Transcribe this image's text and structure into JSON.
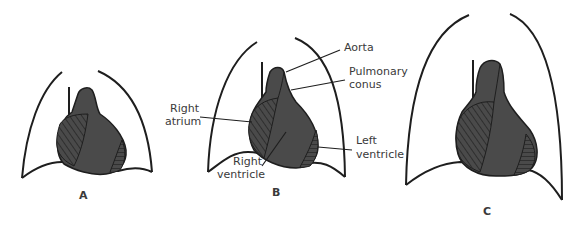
{
  "figure": {
    "panels": [
      {
        "id": "A",
        "letter": "A",
        "description": "Small heart silhouette within chest outline"
      },
      {
        "id": "B",
        "letter": "B",
        "description": "Labeled heart silhouette within chest outline"
      },
      {
        "id": "C",
        "letter": "C",
        "description": "Large chest outline with elongated heart silhouette"
      }
    ],
    "labels": {
      "aorta": "Aorta",
      "pulmonary_conus_line1": "Pulmonary",
      "pulmonary_conus_line2": "conus",
      "right_atrium_line1": "Right",
      "right_atrium_line2": "atrium",
      "left_ventricle_line1": "Left",
      "left_ventricle_line2": "ventricle",
      "right_ventricle_line1": "Right",
      "right_ventricle_line2": "ventricle"
    },
    "colors": {
      "heart_fill": "#4a4a4a",
      "outline": "#1e1e1e",
      "hatch": "#2a2a2a",
      "background": "#ffffff",
      "text": "#3a3a3a"
    }
  }
}
